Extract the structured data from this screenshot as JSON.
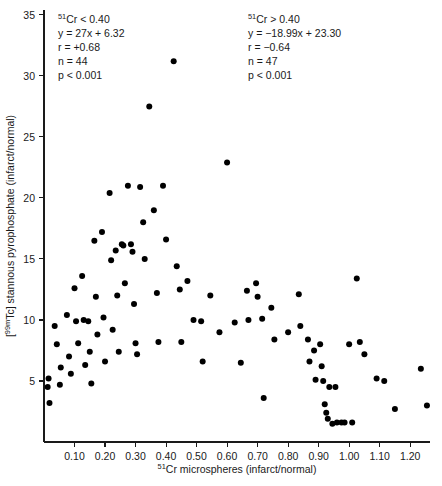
{
  "figure": {
    "background_color": "#ffffff",
    "point_color": "#000000",
    "axis_color": "#1a1a1a"
  },
  "annotations": {
    "left": {
      "name": "low-flow-group",
      "lines": [
        "51Cr < 0.40",
        "y = 27x + 6.32",
        "r = +0.68",
        "n = 44",
        "p < 0.001"
      ],
      "condition": "51Cr < 0.40",
      "equation": "y = 27x + 6.32",
      "r": "r = +0.68",
      "n": "n = 44",
      "p": "p < 0.001"
    },
    "right": {
      "name": "high-flow-group",
      "lines": [
        "51Cr > 0.40",
        "y = -18.99x + 23.30",
        "r = -0.64",
        "n = 47",
        "p < 0.001"
      ],
      "condition": "51Cr > 0.40",
      "equation": "y = −18.99x + 23.30",
      "r": "r = −0.64",
      "n": "n = 47",
      "p": "p < 0.001"
    }
  },
  "chart_data": {
    "type": "scatter",
    "title": "",
    "xlabel": "51Cr microspheres (infarct/normal)",
    "ylabel": "[99mTc] stannous pyrophosphate (infarct/normal)",
    "xlabel_parts": {
      "sup": "51",
      "rest": "Cr microspheres (infarct/normal)"
    },
    "ylabel_parts": {
      "pre": "[",
      "sup": "99m",
      "rest": "Tc] stannous pyrophosphate (infarct/normal)"
    },
    "xlim": [
      0,
      1.265
    ],
    "ylim": [
      0,
      35.4
    ],
    "xticks": [
      0.1,
      0.2,
      0.3,
      0.4,
      0.5,
      0.6,
      0.7,
      0.8,
      0.9,
      1.0,
      1.1,
      1.2
    ],
    "xtick_labels": [
      "0.10",
      "0.20",
      "0.30",
      "0.40",
      "0.50",
      "0.60",
      "0.70",
      "0.80",
      "0.90",
      "1.00",
      "1.10",
      "1.20"
    ],
    "yticks": [
      5,
      10,
      15,
      20,
      25,
      30,
      35
    ],
    "ytick_labels": [
      "5",
      "10",
      "15",
      "20",
      "25",
      "30",
      "35"
    ],
    "grid": false,
    "legend": false,
    "marker": "filled-circle",
    "marker_size_px": 4.2,
    "n_points_total": 91,
    "series": [
      {
        "name": "infarct segments",
        "points": [
          [
            0.015,
            5.2
          ],
          [
            0.012,
            4.5
          ],
          [
            0.018,
            3.2
          ],
          [
            0.035,
            9.5
          ],
          [
            0.042,
            8.0
          ],
          [
            0.055,
            6.1
          ],
          [
            0.052,
            4.7
          ],
          [
            0.075,
            10.4
          ],
          [
            0.082,
            7.0
          ],
          [
            0.088,
            5.6
          ],
          [
            0.1,
            12.6
          ],
          [
            0.105,
            9.9
          ],
          [
            0.112,
            8.1
          ],
          [
            0.125,
            13.6
          ],
          [
            0.13,
            10.0
          ],
          [
            0.135,
            6.3
          ],
          [
            0.145,
            9.9
          ],
          [
            0.15,
            7.4
          ],
          [
            0.155,
            4.8
          ],
          [
            0.165,
            16.5
          ],
          [
            0.17,
            11.9
          ],
          [
            0.175,
            8.8
          ],
          [
            0.19,
            17.2
          ],
          [
            0.195,
            10.2
          ],
          [
            0.2,
            6.6
          ],
          [
            0.215,
            20.4
          ],
          [
            0.22,
            14.9
          ],
          [
            0.225,
            9.2
          ],
          [
            0.235,
            15.7
          ],
          [
            0.24,
            12.0
          ],
          [
            0.245,
            7.4
          ],
          [
            0.255,
            16.2
          ],
          [
            0.26,
            16.1
          ],
          [
            0.265,
            13.0
          ],
          [
            0.275,
            21.0
          ],
          [
            0.285,
            16.2
          ],
          [
            0.29,
            15.6
          ],
          [
            0.295,
            11.3
          ],
          [
            0.3,
            8.1
          ],
          [
            0.305,
            7.2
          ],
          [
            0.315,
            20.9
          ],
          [
            0.325,
            18.0
          ],
          [
            0.33,
            15.0
          ],
          [
            0.345,
            27.5
          ],
          [
            0.36,
            19.0
          ],
          [
            0.37,
            12.2
          ],
          [
            0.375,
            8.2
          ],
          [
            0.39,
            21.0
          ],
          [
            0.4,
            16.6
          ],
          [
            0.425,
            31.2
          ],
          [
            0.435,
            14.4
          ],
          [
            0.445,
            12.5
          ],
          [
            0.45,
            8.2
          ],
          [
            0.47,
            13.2
          ],
          [
            0.49,
            10.0
          ],
          [
            0.515,
            9.9
          ],
          [
            0.52,
            6.6
          ],
          [
            0.545,
            12.0
          ],
          [
            0.575,
            9.0
          ],
          [
            0.6,
            22.9
          ],
          [
            0.625,
            9.8
          ],
          [
            0.645,
            6.5
          ],
          [
            0.665,
            12.4
          ],
          [
            0.67,
            10.0
          ],
          [
            0.695,
            13.0
          ],
          [
            0.7,
            11.9
          ],
          [
            0.715,
            10.1
          ],
          [
            0.72,
            3.6
          ],
          [
            0.745,
            11.0
          ],
          [
            0.755,
            8.4
          ],
          [
            0.8,
            9.0
          ],
          [
            0.835,
            12.1
          ],
          [
            0.84,
            9.5
          ],
          [
            0.865,
            8.4
          ],
          [
            0.87,
            6.6
          ],
          [
            0.885,
            7.5
          ],
          [
            0.89,
            5.1
          ],
          [
            0.905,
            8.0
          ],
          [
            0.91,
            6.2
          ],
          [
            0.915,
            5.0
          ],
          [
            0.92,
            3.1
          ],
          [
            0.925,
            2.4
          ],
          [
            0.93,
            1.9
          ],
          [
            0.935,
            4.5
          ],
          [
            0.945,
            1.5
          ],
          [
            0.955,
            4.5
          ],
          [
            0.96,
            1.6
          ],
          [
            0.975,
            1.6
          ],
          [
            0.985,
            1.6
          ],
          [
            1.0,
            8.0
          ],
          [
            1.01,
            1.6
          ],
          [
            1.025,
            13.4
          ],
          [
            1.035,
            8.2
          ],
          [
            1.05,
            7.2
          ],
          [
            1.09,
            5.2
          ],
          [
            1.115,
            5.0
          ],
          [
            1.15,
            2.7
          ],
          [
            1.235,
            6.0
          ],
          [
            1.255,
            3.0
          ]
        ]
      }
    ]
  }
}
